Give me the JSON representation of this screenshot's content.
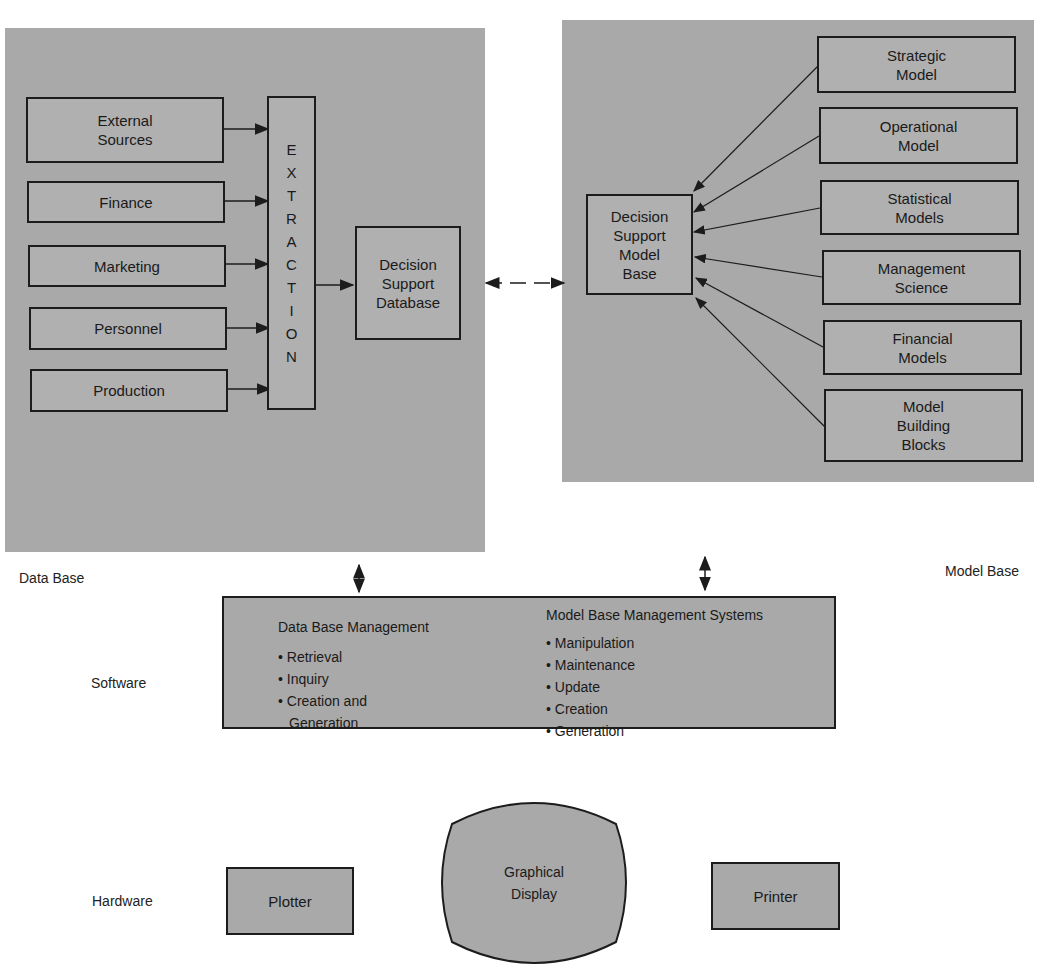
{
  "diagram": {
    "title_fragment": "p",
    "data_base": {
      "label": "Data Base",
      "sources": [
        "External Sources",
        "Finance",
        "Marketing",
        "Personnel",
        "Production"
      ],
      "source_lines": [
        [
          "External",
          "Sources"
        ],
        [
          "Finance"
        ],
        [
          "Marketing"
        ],
        [
          "Personnel"
        ],
        [
          "Production"
        ]
      ],
      "extraction_letters": [
        "E",
        "X",
        "T",
        "R",
        "A",
        "C",
        "T",
        "I",
        "O",
        "N"
      ],
      "database_lines": [
        "Decision",
        "Support",
        "Database"
      ]
    },
    "model_base": {
      "label": "Model Base",
      "model_base_lines": [
        "Decision",
        "Support",
        "Model",
        "Base"
      ],
      "models": [
        [
          "Strategic",
          "Model"
        ],
        [
          "Operational",
          "Model"
        ],
        [
          "Statistical",
          "Models"
        ],
        [
          "Management",
          "Science"
        ],
        [
          "Financial",
          "Models"
        ],
        [
          "Model",
          "Building",
          "Blocks"
        ]
      ]
    },
    "software": {
      "label": "Software",
      "dbm": {
        "heading": "Data Base Management",
        "items": [
          "• Retrieval",
          "• Inquiry",
          "• Creation and",
          "  Generation"
        ]
      },
      "mbms": {
        "heading": "Model Base Management Systems",
        "items": [
          "• Manipulation",
          "• Maintenance",
          "• Update",
          "• Creation",
          "• Generation"
        ]
      }
    },
    "hardware": {
      "label": "Hardware",
      "plotter": "Plotter",
      "display_lines": [
        "Graphical",
        "Display"
      ],
      "printer": "Printer"
    },
    "colors": {
      "panel": "#a9a9a9",
      "box": "#b0b0b0",
      "line": "#1c1c1c"
    }
  }
}
